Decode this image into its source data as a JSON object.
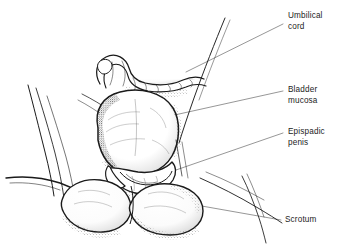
{
  "figure": {
    "type": "medical-line-illustration",
    "background_color": "#ffffff",
    "ink_color": "#1a1a1a",
    "leader_line_color": "#5a5a5a",
    "width": 351,
    "height": 249
  },
  "labels": [
    {
      "id": "umbilical-cord",
      "text": "Umbilical\ncord",
      "x": 288,
      "y": 11,
      "leader": {
        "x1": 283,
        "y1": 24,
        "x2": 185,
        "y2": 72
      }
    },
    {
      "id": "bladder-mucosa",
      "text": "Bladder\nmucosa",
      "x": 288,
      "y": 85,
      "leader": {
        "x1": 283,
        "y1": 91,
        "x2": 152,
        "y2": 120
      }
    },
    {
      "id": "epispadic-penis",
      "text": "Epispadic\npenis",
      "x": 288,
      "y": 127,
      "leader": {
        "x1": 283,
        "y1": 133,
        "x2": 176,
        "y2": 170
      }
    },
    {
      "id": "scrotum",
      "text": "Scrotum",
      "x": 285,
      "y": 215,
      "leader": {
        "x1": 281,
        "y1": 220,
        "x2": 196,
        "y2": 205
      }
    }
  ]
}
